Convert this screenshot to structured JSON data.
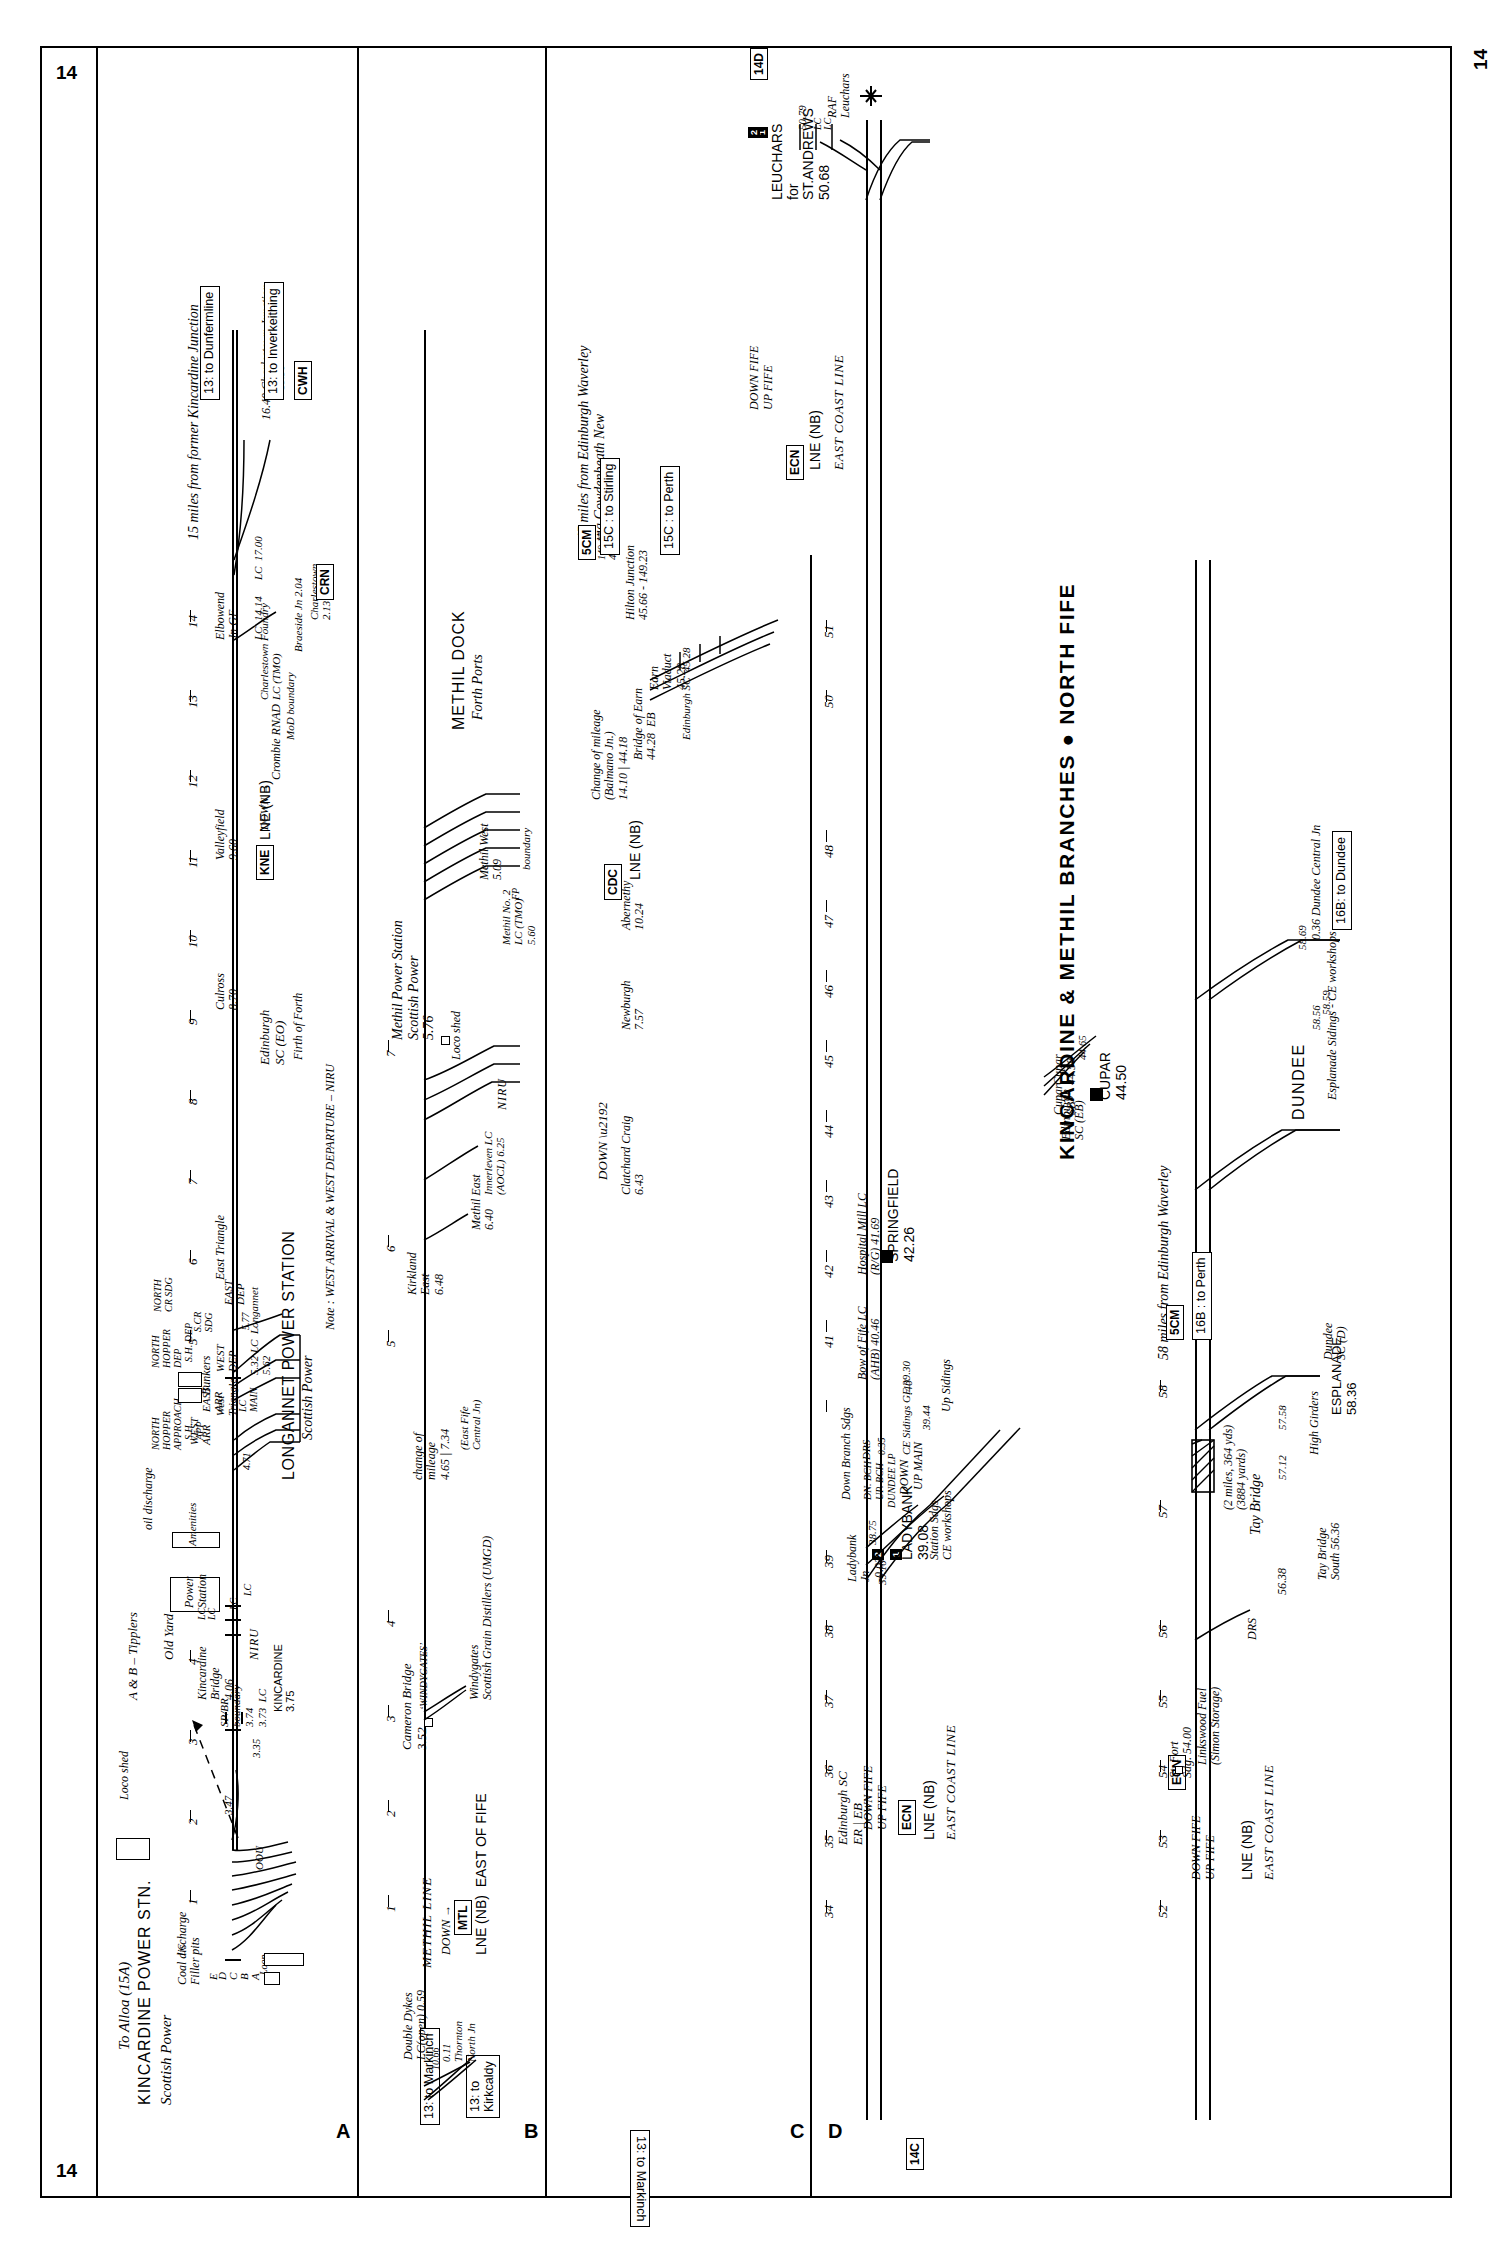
{
  "page": {
    "number": "14",
    "title": "KINCARDINE & METHIL BRANCHES ● NORTH FIFE"
  },
  "rows": [
    {
      "letter": "A"
    },
    {
      "letter": "B"
    },
    {
      "letter": "C"
    },
    {
      "letter": "D"
    }
  ],
  "rowA": {
    "heading": "15 miles from former Kincardine Junction",
    "station_title": "KINCARDINE POWER STN.",
    "operator": "Scottish Power",
    "to_alloa": "To Alloa (15A)",
    "oou": "OOU",
    "coal_discharge": "Coal discharge\nFiller pits",
    "filler_pit_labels": [
      "E",
      "D",
      "C",
      "B",
      "A"
    ],
    "loop": "Loop",
    "loco_shed": "Loco shed",
    "tipplers_note": "A & B – Tipplers",
    "old_yard": "Old Yard",
    "power_station_box": "Power\nStation",
    "amenities_box": "Amenities",
    "oil_discharge": "oil discharge",
    "lc_labels": [
      "LC",
      "LC",
      "LC",
      "LC",
      "LC"
    ],
    "mileages": [
      "3.47",
      "3.35",
      "3.73",
      "3.74",
      "4.06",
      "3.75",
      "4.71",
      "5.32",
      "5.62",
      "5.77"
    ],
    "sp_br_boundary": "SP/BR\nboundary\n3.74",
    "lc_373": "3.73  LC",
    "kincardine": "KINCARDINE\n3.75",
    "kincardine_bridge": "Kincardine\nBridge\n4.06",
    "niru": "NIRU",
    "west_triangle": "West\nTriangle",
    "east_triangle": "East Triangle",
    "west_arr": "WEST\nARR",
    "east_arr": "EAST\nARR",
    "west_dep": "WEST\nDEP",
    "east_dep": "EAST\nDEP",
    "lc_main": "LC\nMAIN",
    "north_hopper_approach": "NORTH\nHOPPER\nAPPROACH",
    "south_hopper_approach": "S.H.\nAPP",
    "north_hopper_dep": "NORTH\nHOPPER\nDEP",
    "sh_dep": "S.H. DEP",
    "north_cr_sdg": "NORTH\nCR SDG",
    "s_cr_sdg": "S.CR\nSDG",
    "bunkers": "Bunkers",
    "longannet_ps": "LONGANNET POWER STATION",
    "longannet_operator": "Scottish Power",
    "lc_longannet": "5.32 LC  Longannet\n5.62",
    "note": "Note : WEST ARRIVAL & WEST DEPARTURE – NIRU",
    "culross": "Culross\n8.70",
    "valleyfield": "Valleyfield\n9.60",
    "elbowend": "Elbowend\nJn GF",
    "lc_1414": "LC  14.14",
    "lc_1700": "LC  17.00",
    "down_arrow": "DOWN →",
    "edinburgh_sc_eo": "Edinburgh\nSC (EO)",
    "firth_of_forth": "Firth of Forth",
    "crombie_rnad": "Crombie RNAD",
    "mod_boundary": "MoD boundary",
    "charlestown_foundry": "Charlestown Foundry\nLC (TMO)",
    "braeside": "Braeside Jn 2.04",
    "charlestown": "Charlestown\n2.13",
    "to_dunfermline": "13: to Dunfermline",
    "to_inverkeithing": "13: to Inverkeithing",
    "charlestown_jn": "16.40 Charlestown Junction",
    "mile_1536": "15.36",
    "codes": [
      "KNE",
      "CWH",
      "CRN"
    ],
    "lne_nb": "LNE (NB)",
    "scale_numbers": [
      "1",
      "2",
      "3",
      "4",
      "5",
      "6",
      "7",
      "8",
      "9",
      "10",
      "11",
      "12",
      "13",
      "14"
    ]
  },
  "rowB": {
    "to_markinch": "13: to Markinch",
    "to_kirkcaldy": "13: to\nKirkcaldy",
    "thornton_north": "0.11\nThornton\nNorth Jn",
    "mile_1066": "10.66",
    "double_dykes": "Double Dykes\nLC(open) 0.59",
    "methil_line": "METHIL LINE",
    "down_arrow": "DOWN →",
    "code_mtl": "MTL",
    "lne_nb_east_of_fife": "LNE (NB)  EAST OF FIFE",
    "cameron_bridge": "Cameron Bridge\n3.52",
    "windygates_lbl": "‘WINDYGATES’",
    "windygates": "Windygates\nScottish Grain Distillers (UMGD)",
    "change_of_mileage": "change of\nmileage\n4.65 | 7.34",
    "east_fife_central": "(East Fife\nCentral Jn)",
    "kirkland_east": "Kirkland\nEast\n6.48",
    "methil_east": "Methil East\n6.40",
    "innerleven": "Innerleven LC\n(AOCL) 6.25",
    "niru": "NIRU",
    "loco_shed": "Loco shed",
    "methil_ps": "Methil Power Station\nScottish Power\n5.76",
    "methil_no2": "Methil No. 2\nLC (TMO)\n5.60",
    "methil_west": "Methil West\n5.09",
    "methil_dock": "METHIL DOCK",
    "forth_ports": "Forth Ports",
    "boundary": "boundary",
    "fp": "FP",
    "scale_numbers": [
      "1",
      "2",
      "3",
      "4",
      "5",
      "6",
      "7"
    ]
  },
  "rowC": {
    "heading": "45 miles from Edinburgh Waverley\nvia Cowdenbeath New",
    "to_markinch": "13: to Markinch",
    "edinburgh_sc": "Edinburgh SC\nER | EB",
    "edinburgh_sc_eb": "Edinburgh\nSC (EB)",
    "cupar_sc": "Cupar\nSB",
    "down_fife": "DOWN FIFE",
    "up_fife": "UP FIFE",
    "code_ecn": "ECN",
    "lne_nb": "LNE (NB)",
    "east_coast_line": "EAST COAST LINE",
    "ladybank_jn": "Ladybank\nJn\n-0.03",
    "mile_3875": "38.75",
    "mile_3910": "39.10",
    "ladybank": "LADYBANK\n39.08",
    "station_sdgs": "Station Sdgs\nCE workshops",
    "down_branch_sdgs": "Down Branch Sdgs",
    "dn_bch": "DN. BCH",
    "up_bch": "UP. BCH",
    "drs": "DRS",
    "mile_035": "0.35",
    "dundee_lp": "DUNDEE LP",
    "down": "DOWN",
    "up_main": "UP MAIN",
    "ce_sidings_gf": "CE Sidings GF 39.30",
    "mile_3944": "39.44",
    "up_sidings": "Up Sidings",
    "mile_40": ".40",
    "bow_of_fife": "Bow of Fife LC\n(AHB) 40.46",
    "hospital_mill": "Hospital Mill LC\n(R/G) 41.69",
    "springfield": "SPRINGFIELD\n42.26",
    "cupar_station": "CUPAR\n44.50",
    "cupar_jn": "Cupar\n44.58",
    "mile_4465": "44.65",
    "clatchard_craig": "Clatchard Craig\n6.43",
    "newburgh": "Newburgh\n7.57",
    "abernethy": "Abernethy\n10.24",
    "code_cdc": "CDC",
    "lne_nb_2": "LNE (NB)",
    "change_of_mileage": "Change of mileage\n(Balmano Jn.)\n14.10 | 44.18",
    "bridge_of_earn": "Bridge of Earn\n44.28  EB",
    "earn_viaduct": "Earn\nViaduct\n45.28",
    "edinburgh_sc_45": "Edinburgh SC  45.28",
    "hilton_junction": "Hilton Junction\n45.66 - 149.23",
    "mile_14917": "149.17",
    "mile_4533": "45.33",
    "code_5cm": "5CM",
    "to_stirling": "15C : to Stirling",
    "to_perth": "15C : to Perth",
    "leuchars": "LEUCHARS\nfor\nST.ANDREWS\n50.68",
    "mile_5079": "50.79",
    "lc_labels": [
      "LC",
      "LC"
    ],
    "raf_leuchars": "RAF\nLeuchars",
    "code_14d": "14D",
    "scale_numbers": [
      "34",
      "35",
      "36",
      "37",
      "38",
      "39",
      "40",
      "41",
      "42",
      "43",
      "44",
      "45",
      "46",
      "47",
      "48",
      "50",
      "51"
    ],
    "scale_numbers_2": [
      "1",
      "2",
      "3",
      "4",
      "5",
      "6",
      "7",
      "8",
      "9",
      "10",
      "11",
      "12",
      "13",
      "14"
    ]
  },
  "rowD": {
    "heading": "58 miles from Edinburgh Waverley",
    "code_14c": "14C",
    "down_fife": "DOWN FIFE",
    "up_fife": "UP FIFE",
    "code_ecn": "ECN",
    "lne_nb": "LNE (NB)",
    "east_coast_line": "EAST COAST LINE",
    "st_fort": "St. Fort\nSdg. 54.00",
    "linkswood": "Linkswood Fuel\n(Simon Storage)",
    "drs": "DRS",
    "mile_5638": "56.38",
    "tay_bridge_south": "Tay Bridge\nSouth 56.36",
    "tay_bridge": "Tay Bridge",
    "tay_bridge_len": "(2 miles, 364 yds)\n(3884 yards)",
    "mile_5712": "57.12",
    "mile_5758": "57.58",
    "high_girders": "High Girders",
    "esplanade": "ESPLANADE\n58.36",
    "dundee_sc": "Dundee\nSC (D)",
    "dundee": "DUNDEE",
    "esplanade_sidings": "Esplanade Sidings - CE workshops",
    "mile_5856": "58.56",
    "mile_5859": "58.59",
    "mile_5869": "58.69",
    "dundee_central": "0.36 Dundee Central Jn",
    "code_5cm": "5CM",
    "to_perth": "16B : to Perth",
    "to_dundee": "16B: to Dundee",
    "scale_numbers": [
      "52",
      "53",
      "54",
      "55",
      "56",
      "57",
      "58"
    ]
  },
  "colors": {
    "ink": "#000000",
    "paper": "#ffffff"
  }
}
